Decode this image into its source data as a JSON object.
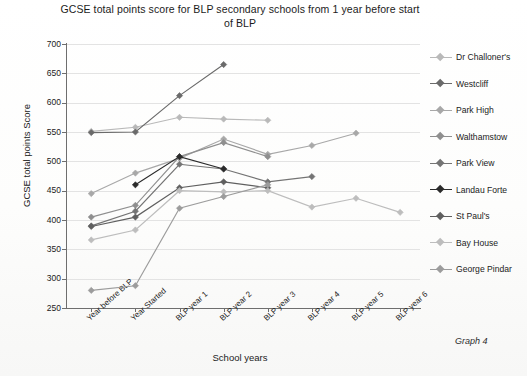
{
  "chart_data": {
    "type": "line",
    "title": "GCSE total points score for BLP secondary schools from 1 year before start of BLP",
    "xlabel": "School years",
    "ylabel": "GCSE total points  Score",
    "categories": [
      "Year before BLP",
      "Year Started",
      "BLP year 1",
      "BLP year 2",
      "BLP year 3",
      "BLP year 4",
      "BLP year 5",
      "BLP year 6"
    ],
    "ylim": [
      250,
      700
    ],
    "ytick_step": 50,
    "yticks": [
      250,
      300,
      350,
      400,
      450,
      500,
      550,
      600,
      650,
      700
    ],
    "grid": true,
    "legend_position": "right",
    "marker": "diamond",
    "series": [
      {
        "name": "Dr Challoner's",
        "color": "#b9b9b9",
        "values": [
          551,
          558,
          575,
          572,
          570,
          null,
          null,
          null
        ]
      },
      {
        "name": "Westcliff",
        "color": "#6a6a6a",
        "values": [
          549,
          550,
          612,
          665,
          null,
          null,
          null,
          null
        ]
      },
      {
        "name": "Park High",
        "color": "#a8a8a8",
        "values": [
          445,
          480,
          505,
          538,
          512,
          527,
          548,
          null
        ]
      },
      {
        "name": "Walthamstow",
        "color": "#8f8f8f",
        "values": [
          405,
          425,
          508,
          532,
          508,
          null,
          null,
          null
        ]
      },
      {
        "name": "Park View",
        "color": "#747474",
        "values": [
          390,
          415,
          495,
          487,
          465,
          474,
          null,
          null
        ]
      },
      {
        "name": "Landau Forte",
        "color": "#2b2b2b",
        "values": [
          null,
          460,
          508,
          487,
          null,
          null,
          null,
          null
        ]
      },
      {
        "name": "St Paul's",
        "color": "#5f5f5f",
        "values": [
          389,
          405,
          455,
          465,
          455,
          null,
          null,
          null
        ]
      },
      {
        "name": "Bay House",
        "color": "#bdbdbd",
        "values": [
          366,
          383,
          450,
          448,
          450,
          422,
          437,
          413
        ]
      },
      {
        "name": "George Pindar",
        "color": "#9c9c9c",
        "values": [
          280,
          288,
          420,
          440,
          460,
          null,
          null,
          null
        ]
      }
    ]
  },
  "annotations": {
    "graph_number": "Graph 4"
  }
}
